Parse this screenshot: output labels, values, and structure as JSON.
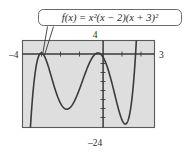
{
  "figure": {
    "callout_label": "f(x) = x²(x − 2)(x + 3)²",
    "axis_labels": {
      "top": "4",
      "left": "–4",
      "right": "3",
      "bottom": "–24"
    },
    "colors": {
      "plot_background": "#dedede",
      "frame": "#5a5a5a",
      "curve": "#3a3a3a",
      "axis": "#3a3a3a",
      "text": "#2b2b2b",
      "page_background": "#ffffff"
    }
  },
  "chart_data": {
    "type": "line",
    "title": "f(x) = x²(x − 2)(x + 3)²",
    "xlabel": "",
    "ylabel": "",
    "xlim": [
      -4,
      3
    ],
    "ylim": [
      -24,
      4
    ],
    "grid": false,
    "legend": null,
    "x_tick_labels": [
      "–4",
      "3"
    ],
    "y_tick_labels": [
      "4",
      "–24"
    ],
    "expression": "x^2*(x-2)*(x+3)^2",
    "roots": [
      -3,
      0,
      2
    ],
    "annotations": [
      {
        "text": "4",
        "position": "top-of-y-axis"
      },
      {
        "text": "–4",
        "position": "left-of-x-axis"
      },
      {
        "text": "3",
        "position": "right-of-x-axis"
      },
      {
        "text": "–24",
        "position": "below-plot"
      }
    ],
    "series": [
      {
        "name": "f(x) = x²(x − 2)(x + 3)²",
        "x": [
          -4.0,
          -3.9,
          -3.8,
          -3.7,
          -3.6,
          -3.5,
          -3.4,
          -3.3,
          -3.2,
          -3.1,
          -3.0,
          -2.9,
          -2.8,
          -2.7,
          -2.6,
          -2.5,
          -2.4,
          -2.3,
          -2.2,
          -2.1,
          -2.0,
          -1.9,
          -1.8,
          -1.7,
          -1.6,
          -1.5,
          -1.4,
          -1.3,
          -1.2,
          -1.1,
          -1.0,
          -0.9,
          -0.8,
          -0.7,
          -0.6,
          -0.5,
          -0.4,
          -0.3,
          -0.2,
          -0.1,
          0.0,
          0.1,
          0.2,
          0.3,
          0.4,
          0.5,
          0.6,
          0.7,
          0.8,
          0.9,
          1.0,
          1.1,
          1.2,
          1.3,
          1.4,
          1.5,
          1.6,
          1.7,
          1.8,
          1.9,
          2.0,
          2.1,
          2.2,
          2.3,
          2.4,
          2.5,
          2.6,
          2.7,
          2.8,
          2.9,
          3.0
        ],
        "y": [
          -96.0,
          -73.06,
          -54.36,
          -39.41,
          -27.72,
          -18.81,
          -12.23,
          -7.54,
          -4.3,
          -2.11,
          0.0,
          -1.48,
          -2.66,
          -3.59,
          -4.32,
          -4.92,
          -5.41,
          -5.85,
          -6.27,
          -6.71,
          -7.2,
          -7.77,
          -8.44,
          -9.23,
          -10.15,
          -11.2,
          -12.4,
          -13.73,
          -15.19,
          -16.76,
          -18.42,
          -20.15,
          -21.91,
          -23.65,
          -25.33,
          -26.89,
          -28.25,
          -29.34,
          -30.06,
          -30.31,
          0.0,
          -0.25,
          -1.06,
          -2.45,
          -4.42,
          -6.89,
          -9.73,
          -12.72,
          -15.58,
          -17.98,
          -19.6,
          -20.12,
          -19.27,
          -16.84,
          -12.7,
          -6.81,
          0.75,
          9.73,
          20.78,
          33.45,
          48.0,
          64.19,
          82.05,
          101.6,
          122.9,
          146.0,
          171.0,
          197.9,
          226.8,
          257.7,
          290.7
        ]
      }
    ]
  }
}
